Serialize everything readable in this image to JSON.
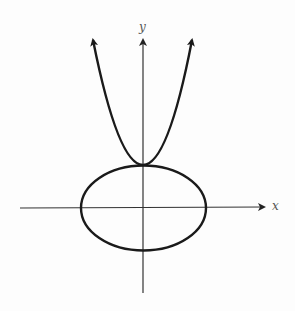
{
  "diagram": {
    "type": "graph-of-relations",
    "axes": {
      "x_label": "x",
      "y_label": "y"
    },
    "curves": [
      {
        "name": "parabola",
        "shape": "upward-opening parabola",
        "vertex": "top of ellipse on y-axis",
        "arrows": "both ends upward"
      },
      {
        "name": "ellipse",
        "shape": "horizontal ellipse centered at origin",
        "orientation": "wider than tall"
      }
    ],
    "colors": {
      "curve": "#1a1a1a",
      "axis": "#333333",
      "label": "#555555",
      "background": "#fdfdfd"
    }
  }
}
